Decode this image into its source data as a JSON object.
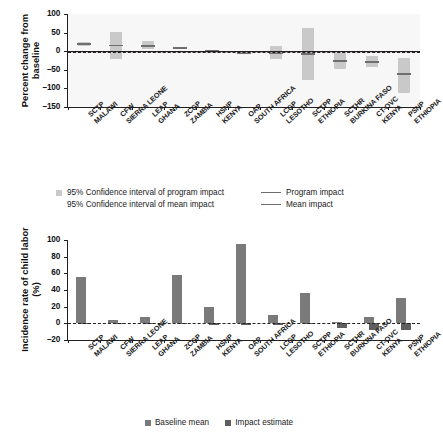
{
  "chart_data": [
    {
      "type": "bar",
      "panel": "top",
      "title": "",
      "xlabel": "",
      "ylabel": "Percent change from baseline",
      "ylim": [
        -150,
        100
      ],
      "yticks": [
        100,
        50,
        0,
        -50,
        -100,
        -150
      ],
      "grid": false,
      "categories": [
        {
          "program": "SCTP",
          "country": "MALAWI"
        },
        {
          "program": "CFW",
          "country": "SIERRA LEONE"
        },
        {
          "program": "LEAP",
          "country": "GHANA"
        },
        {
          "program": "ZCGP",
          "country": "ZAMBIA"
        },
        {
          "program": "HSNP",
          "country": "KENYA"
        },
        {
          "program": "OAP",
          "country": "SOUTH AFRICA"
        },
        {
          "program": "LCGP",
          "country": "LESOTHO"
        },
        {
          "program": "SCTPP",
          "country": "ETHIOPIA"
        },
        {
          "program": "SCTHR",
          "country": "BURKINA FASO"
        },
        {
          "program": "CT-OVC",
          "country": "KENYA"
        },
        {
          "program": "PSNP",
          "country": "ETHIOPIA"
        }
      ],
      "series": [
        {
          "name": "95% Confidence interval of program impact",
          "type": "interval",
          "low": [
            13,
            -22,
            6,
            8,
            0,
            -8,
            -20,
            -78,
            -48,
            -42,
            -112
          ],
          "high": [
            25,
            52,
            27,
            11,
            4,
            0,
            14,
            63,
            -4,
            -14,
            -17
          ]
        },
        {
          "name": "Program impact",
          "type": "line-marker",
          "values": [
            20,
            15,
            14,
            9,
            2,
            -5,
            -5,
            -7,
            -26,
            -29,
            -62
          ]
        },
        {
          "name": "95% Confidence interval of mean impact",
          "type": "interval-mean",
          "low": -1.5,
          "high": 1.5
        },
        {
          "name": "Mean impact",
          "type": "mean-line",
          "value": 0
        }
      ],
      "legend": {
        "position": "below",
        "entries": [
          {
            "label": "95% Confidence interval of program impact",
            "marker": "swatch",
            "color": "#c9c9c9"
          },
          {
            "label": "Program impact",
            "marker": "line",
            "color": "#6f6f6f"
          },
          {
            "label": "95% Confidence interval of mean impact",
            "marker": "none",
            "color": "#c9c9c9"
          },
          {
            "label": "Mean impact",
            "marker": "line",
            "color": "#6f6f6f"
          }
        ]
      }
    },
    {
      "type": "bar",
      "panel": "bottom",
      "title": "",
      "xlabel": "",
      "ylabel": "Incidence rate of child labor (%)",
      "ylim": [
        -20,
        100
      ],
      "yticks": [
        100,
        80,
        60,
        40,
        20,
        0,
        -20
      ],
      "grid": false,
      "categories": [
        {
          "program": "SCTP",
          "country": "MALAWI"
        },
        {
          "program": "CFW",
          "country": "SIERRA LEONE"
        },
        {
          "program": "LEAP",
          "country": "GHANA"
        },
        {
          "program": "ZCGP",
          "country": "ZAMBIA"
        },
        {
          "program": "HSNP",
          "country": "KENYA"
        },
        {
          "program": "OAP",
          "country": "SOUTH AFRICA"
        },
        {
          "program": "LCGP",
          "country": "LESOTHO"
        },
        {
          "program": "SCTPP",
          "country": "ETHIOPIA"
        },
        {
          "program": "SCTHR",
          "country": "BURKINA FASO"
        },
        {
          "program": "CT-OVC",
          "country": "KENYA"
        },
        {
          "program": "PSNP",
          "country": "ETHIOPIA"
        }
      ],
      "series": [
        {
          "name": "Baseline mean",
          "color": "#7a7a7a",
          "values": [
            56,
            4,
            8,
            58,
            20,
            95,
            10,
            37,
            2,
            8,
            30
          ]
        },
        {
          "name": "Impact estimate",
          "color": "#5f5f5f",
          "values": [
            1,
            0.5,
            0.8,
            0.7,
            0.4,
            -2,
            -2.5,
            0.6,
            -6,
            -8,
            -8
          ]
        }
      ],
      "legend": {
        "position": "below",
        "entries": [
          {
            "label": "Baseline mean",
            "color": "#7a7a7a"
          },
          {
            "label": "Impact estimate",
            "color": "#5f5f5f"
          }
        ]
      }
    }
  ],
  "panel_a": {
    "ylabel_line1": "Percent change from",
    "ylabel_line2": "baseline",
    "yticks": [
      "100",
      "50",
      "0",
      "–50",
      "–100",
      "–150"
    ]
  },
  "panel_b": {
    "ylabel_line1": "Incidence rate of",
    "ylabel_line2": "child labor (%)",
    "yticks": [
      "100",
      "80",
      "60",
      "40",
      "20",
      "0",
      "–20"
    ]
  },
  "legend_a": {
    "row1_left": "95% Confidence interval of program impact",
    "row1_right": "Program impact",
    "row2_left": "95% Confidence interval of mean impact",
    "row2_right": "Mean impact"
  },
  "legend_b": {
    "item1": "Baseline mean",
    "item2": "Impact estimate"
  }
}
